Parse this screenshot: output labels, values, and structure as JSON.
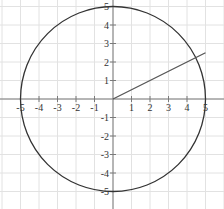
{
  "chart_data": {
    "type": "line",
    "title": "",
    "xlabel": "",
    "ylabel": "",
    "xlim": [
      -6.1,
      6.0
    ],
    "ylim": [
      -5.9,
      5.35
    ],
    "grid": true,
    "legend": null,
    "x_ticks": [
      -5,
      -4,
      -3,
      -2,
      -1,
      1,
      2,
      3,
      4,
      5
    ],
    "y_ticks": [
      5,
      4,
      3,
      2,
      1,
      -1,
      -2,
      -3,
      -4,
      -5
    ],
    "x_tick_labels": [
      "-5",
      "-4",
      "-3",
      "-2",
      "-1",
      "1",
      "2",
      "3",
      "4",
      "5"
    ],
    "y_tick_labels": [
      "5",
      "4",
      "3",
      "2",
      "1",
      "-1",
      "-2",
      "-3",
      "-4",
      "-5"
    ],
    "series": [
      {
        "name": "circle",
        "kind": "circle",
        "center": [
          0,
          0
        ],
        "radius": 5,
        "color": "#333333"
      },
      {
        "name": "line",
        "kind": "polyline",
        "x": [
          0,
          1,
          2,
          3,
          4,
          5
        ],
        "y": [
          0,
          0.5,
          1.0,
          1.5,
          2.0,
          2.5
        ],
        "color": "#555555"
      }
    ]
  },
  "colors": {
    "grid": "#e2e2e2",
    "axis": "#7a7a7a",
    "circle": "#333333",
    "line": "#555555",
    "text": "#333333"
  }
}
